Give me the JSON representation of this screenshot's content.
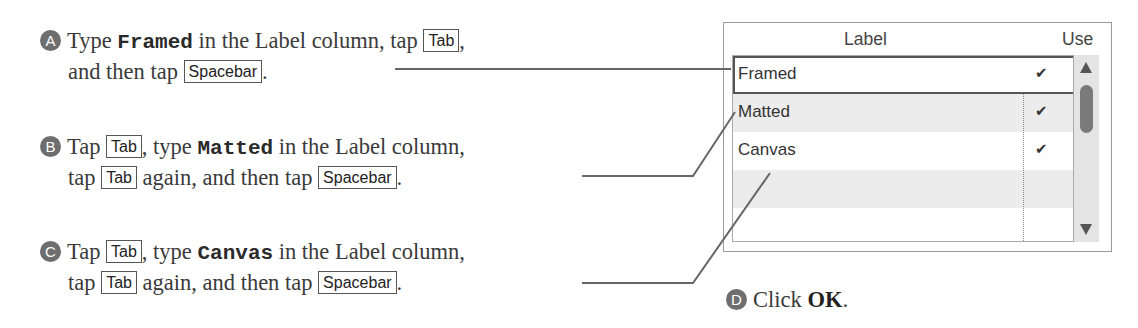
{
  "steps": [
    {
      "badge": "A",
      "line1": {
        "pre": "Type ",
        "code": "Framed",
        "post": " in the Label column, tap ",
        "key": "Tab",
        "end": ","
      },
      "line2": {
        "pre": "and then tap ",
        "key": "Spacebar",
        "end": "."
      }
    },
    {
      "badge": "B",
      "line1": {
        "pre": "Tap ",
        "key": "Tab",
        "mid": ", type ",
        "code": "Matted",
        "post": " in the Label column,"
      },
      "line2": {
        "pre": "tap ",
        "key": "Tab",
        "mid": " again, and then tap ",
        "key2": "Spacebar",
        "end": "."
      }
    },
    {
      "badge": "C",
      "line1": {
        "pre": "Tap ",
        "key": "Tab",
        "mid": ", type ",
        "code": "Canvas",
        "post": " in the Label column,"
      },
      "line2": {
        "pre": "tap ",
        "key": "Tab",
        "mid": " again, and then tap ",
        "key2": "Spacebar",
        "end": "."
      }
    },
    {
      "badge": "D",
      "pre": "Click ",
      "bold": "OK",
      "end": "."
    }
  ],
  "table": {
    "headers": {
      "label": "Label",
      "use": "Use"
    },
    "rows": [
      {
        "label": "Framed",
        "use": "✔"
      },
      {
        "label": "Matted",
        "use": "✔"
      },
      {
        "label": "Canvas",
        "use": "✔"
      },
      {
        "label": "",
        "use": ""
      },
      {
        "label": "",
        "use": ""
      }
    ]
  },
  "colors": {
    "badge": "#6e6e6e",
    "callout_line": "#666666",
    "row_alt": "#ececec"
  }
}
